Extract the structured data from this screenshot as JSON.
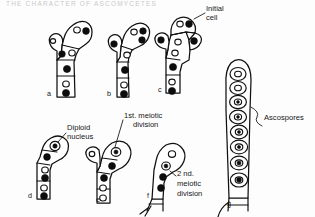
{
  "figure": {
    "header_text": "THE CHARACTER OF ASCOMYCETES",
    "background_color": "#fdfdfd",
    "ink_color": "#111111",
    "caption_labels": [
      {
        "id": "a",
        "text": "a",
        "x": 47,
        "y": 96
      },
      {
        "id": "b",
        "text": "b",
        "x": 107,
        "y": 96
      },
      {
        "id": "c",
        "text": "c",
        "x": 158,
        "y": 92
      },
      {
        "id": "d",
        "text": "d",
        "x": 28,
        "y": 198
      },
      {
        "id": "e",
        "text": "e",
        "x": 96,
        "y": 202
      },
      {
        "id": "f",
        "text": "f",
        "x": 147,
        "y": 198
      },
      {
        "id": "g",
        "text": "g",
        "x": 227,
        "y": 206
      }
    ],
    "annotations": [
      {
        "id": "initial-cell",
        "line1": "Initial",
        "line2": "cell",
        "x": 197,
        "y": 13
      },
      {
        "id": "diploid-nucleus",
        "line1": "Diploid",
        "line2": "nucleus",
        "x": 56,
        "y": 117
      },
      {
        "id": "first-meiotic-division",
        "line1": "1st. meiotic",
        "line2": "division",
        "x": 126,
        "y": 110
      },
      {
        "id": "second-meiotic-division",
        "line1": "2 nd.",
        "line2": "meiotic",
        "line3": "division",
        "x": 178,
        "y": 172
      },
      {
        "id": "ascospores",
        "line1": "Ascospores",
        "x": 265,
        "y": 117
      }
    ],
    "ascospore_count": 8,
    "stages": [
      {
        "id": "a",
        "name": "crozier-formation",
        "nuclei_dark": 4,
        "nuclei_open": 3
      },
      {
        "id": "b",
        "name": "crozier-hook",
        "nuclei_dark": 4,
        "nuclei_open": 3
      },
      {
        "id": "c",
        "name": "initial-cell-formed",
        "nuclei_dark": 4,
        "nuclei_open": 3
      },
      {
        "id": "d",
        "name": "karyogamy-diploid-nucleus",
        "nuclei_dark": 4,
        "nuclei_open": 3
      },
      {
        "id": "e",
        "name": "first-meiotic-division",
        "nuclei_dark": 3,
        "nuclei_open": 3
      },
      {
        "id": "f",
        "name": "second-meiotic-division",
        "nuclei_dark": 3,
        "nuclei_open": 2
      },
      {
        "id": "g",
        "name": "mature-ascus-with-ascospores",
        "nuclei_dark": 0,
        "nuclei_open": 8
      }
    ]
  }
}
